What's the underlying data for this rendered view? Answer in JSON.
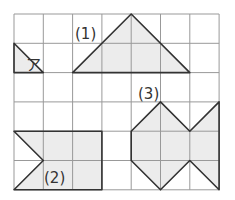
{
  "grid": {
    "cols": 7,
    "rows": 6,
    "x0": 14,
    "y0": 14,
    "cell": 29.3,
    "line_color": "#999999"
  },
  "colors": {
    "fill": "#ececec",
    "stroke": "#333333"
  },
  "labels": {
    "a": "ア",
    "one": "(1)",
    "two": "(2)",
    "three": "(3)"
  },
  "shapes": [
    {
      "name": "shape-a",
      "points": [
        [
          0,
          1
        ],
        [
          0,
          2
        ],
        [
          1,
          2
        ]
      ]
    },
    {
      "name": "shape-1",
      "points": [
        [
          2,
          2
        ],
        [
          4,
          0
        ],
        [
          6,
          2
        ]
      ]
    },
    {
      "name": "shape-2",
      "points": [
        [
          0,
          4
        ],
        [
          3,
          4
        ],
        [
          3,
          6
        ],
        [
          0,
          6
        ],
        [
          1,
          5
        ]
      ]
    },
    {
      "name": "shape-3",
      "points": [
        [
          5,
          3
        ],
        [
          6,
          4
        ],
        [
          7,
          3
        ],
        [
          7,
          6
        ],
        [
          6,
          5
        ],
        [
          5,
          6
        ],
        [
          4,
          5
        ],
        [
          4,
          4
        ]
      ]
    }
  ]
}
